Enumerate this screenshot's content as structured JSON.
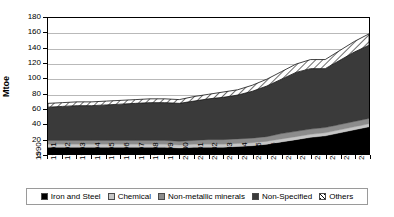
{
  "chart_data": {
    "type": "area",
    "stacked": true,
    "title": "",
    "xlabel": "",
    "ylabel": "Mtoe",
    "ylim": [
      0,
      180
    ],
    "ytick_step": 20,
    "yticks": [
      0,
      20,
      40,
      60,
      80,
      100,
      120,
      140,
      160,
      180
    ],
    "grid": true,
    "legend_position": "bottom",
    "categories": [
      "1990",
      "1991",
      "1992",
      "1993",
      "1994",
      "1995",
      "1996",
      "1997",
      "1998",
      "1999",
      "2000",
      "2001",
      "2002",
      "2003",
      "2004",
      "2005",
      "2006",
      "2007",
      "2008",
      "2009",
      "2010",
      "2011",
      "2012"
    ],
    "series": [
      {
        "name": "Iron and Steel",
        "color": "#000000",
        "pattern": "solid",
        "values": [
          9,
          9,
          9,
          9,
          9,
          9,
          9,
          9,
          9,
          8,
          9,
          9,
          9,
          10,
          11,
          13,
          16,
          19,
          22,
          24,
          28,
          32,
          36
        ]
      },
      {
        "name": "Chemical",
        "color": "#c6c6c6",
        "pattern": "solid",
        "values": [
          4,
          4,
          4,
          4,
          4,
          4,
          4,
          4,
          4,
          4,
          4,
          4,
          4,
          4,
          4,
          4,
          4,
          4,
          4,
          4,
          4,
          4,
          4
        ]
      },
      {
        "name": "Non-metallic minerals",
        "color": "#8c8c8c",
        "pattern": "solid",
        "values": [
          5,
          5,
          5,
          5,
          5,
          5,
          5,
          5,
          5,
          5,
          5,
          6,
          6,
          6,
          6,
          6,
          7,
          7,
          7,
          7,
          7,
          7,
          7
        ]
      },
      {
        "name": "Non-Specified",
        "color": "#3a3a3a",
        "pattern": "solid",
        "values": [
          44,
          45,
          46,
          46,
          47,
          48,
          49,
          50,
          50,
          50,
          52,
          54,
          56,
          58,
          62,
          67,
          72,
          78,
          80,
          78,
          85,
          92,
          97
        ]
      },
      {
        "name": "Others",
        "color": "#ffffff",
        "pattern": "diagonal-hatch",
        "values": [
          5,
          5,
          5,
          5,
          5,
          5,
          5,
          5,
          5,
          5,
          6,
          6,
          7,
          7,
          8,
          9,
          10,
          11,
          12,
          12,
          13,
          14,
          15
        ]
      }
    ],
    "totals": [
      67,
      68,
      69,
      69,
      70,
      71,
      72,
      73,
      73,
      72,
      76,
      79,
      82,
      85,
      91,
      99,
      109,
      119,
      125,
      125,
      137,
      149,
      159
    ]
  },
  "legend": {
    "items": [
      {
        "label": "Iron and Steel"
      },
      {
        "label": "Chemical"
      },
      {
        "label": "Non-metallic minerals"
      },
      {
        "label": "Non-Specified"
      },
      {
        "label": "Others"
      }
    ]
  }
}
